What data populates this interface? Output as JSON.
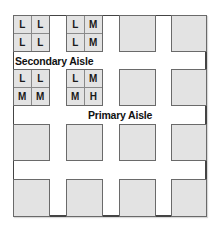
{
  "diagram": {
    "title": "",
    "aisles": {
      "secondary": "Secondary Aisle",
      "primary": "Primary Aisle"
    },
    "grid": {
      "rows": 4,
      "cols": 4
    },
    "labeled_blocks": [
      {
        "row": 1,
        "col": 1,
        "cells": [
          "L",
          "L",
          "L",
          "L"
        ]
      },
      {
        "row": 1,
        "col": 2,
        "cells": [
          "L",
          "M",
          "L",
          "M"
        ]
      },
      {
        "row": 2,
        "col": 1,
        "cells": [
          "L",
          "L",
          "M",
          "M"
        ]
      },
      {
        "row": 2,
        "col": 2,
        "cells": [
          "L",
          "M",
          "M",
          "H"
        ]
      }
    ],
    "colors": {
      "block_fill": "#e3e3e3",
      "block_border": "#6a6a6a",
      "frame_border": "#444444"
    }
  }
}
